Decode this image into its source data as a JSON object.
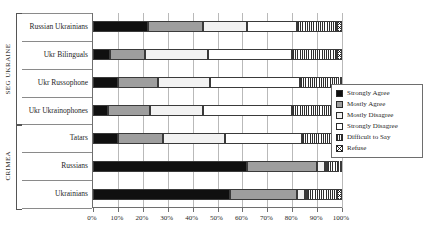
{
  "chart_data": {
    "type": "bar",
    "subtype": "stacked-horizontal-100pct",
    "title": "",
    "xlabel": "",
    "ylabel": "",
    "xlim": [
      0,
      100
    ],
    "xticks": [
      "0%",
      "10%",
      "20%",
      "30%",
      "40%",
      "50%",
      "60%",
      "70%",
      "80%",
      "90%",
      "100%"
    ],
    "xtick_values": [
      0,
      10,
      20,
      30,
      40,
      50,
      60,
      70,
      80,
      90,
      100
    ],
    "grid": true,
    "legend_position": "right",
    "groups": [
      {
        "name": "SEG UKRAINE",
        "categories": [
          "Russian Ukrainians",
          "Ukr Bilinguals",
          "Ukr Russophone",
          "Ukr Ukrainophones"
        ]
      },
      {
        "name": "CRIMEA",
        "categories": [
          "Tatars",
          "Russians",
          "Ukrainians"
        ]
      }
    ],
    "categories": [
      "Russian Ukrainians",
      "Ukr Bilinguals",
      "Ukr Russophone",
      "Ukr Ukrainophones",
      "Tatars",
      "Russians",
      "Ukrainians"
    ],
    "series": [
      {
        "name": "Strongly Agree",
        "key": "strongly-agree",
        "color": "#101010",
        "values": [
          22,
          7,
          10,
          6,
          10,
          62,
          55
        ]
      },
      {
        "name": "Mostly Agree",
        "key": "mostly-agree",
        "color": "#9e9e9e",
        "values": [
          22,
          14,
          16,
          17,
          18,
          28,
          27
        ]
      },
      {
        "name": "Mostly Disagree",
        "key": "mostly-disagree",
        "color": "#f2f2f2",
        "values": [
          18,
          25,
          21,
          21,
          25,
          3,
          3
        ]
      },
      {
        "name": "Strongly Disagree",
        "key": "strongly-disagree",
        "color": "#ffffff",
        "values": [
          20,
          34,
          36,
          36,
          31,
          1,
          1
        ]
      },
      {
        "name": "Difficult to Say",
        "key": "difficult-to-say",
        "color": "hatch-vertical",
        "values": [
          16,
          18,
          16,
          17,
          15,
          5,
          12
        ]
      },
      {
        "name": "Refuse",
        "key": "refuse",
        "color": "hatch-cross",
        "values": [
          2,
          2,
          1,
          3,
          1,
          1,
          2
        ]
      }
    ],
    "legend": [
      {
        "label": "Strongly Agree",
        "swatch": "strongly-agree"
      },
      {
        "label": "Mostly Agree",
        "swatch": "mostly-agree"
      },
      {
        "label": "Mostly Disagree",
        "swatch": "mostly-disagree"
      },
      {
        "label": "Strongly Disagree",
        "swatch": "strongly-disagree"
      },
      {
        "label": "Difficult to Say",
        "swatch": "difficult-to-say"
      },
      {
        "label": "Refuse",
        "swatch": "refuse"
      }
    ]
  }
}
